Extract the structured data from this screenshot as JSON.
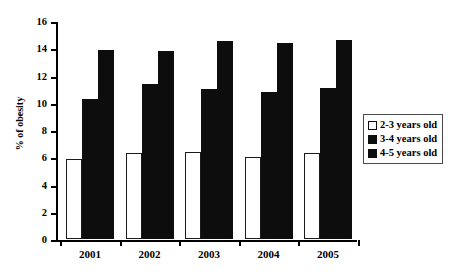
{
  "chart_data": {
    "type": "bar",
    "title": "",
    "xlabel": "",
    "ylabel": "% of obesity",
    "ylim": [
      0,
      16
    ],
    "ytick_labels": [
      "0",
      "2",
      "4",
      "6",
      "8",
      "10",
      "12",
      "14",
      "16"
    ],
    "ytick_values": [
      0,
      2,
      4,
      6,
      8,
      10,
      12,
      14,
      16
    ],
    "grid": false,
    "legend_position": "right",
    "categories": [
      "2001",
      "2002",
      "2003",
      "2004",
      "2005"
    ],
    "series": [
      {
        "name": "2-3 years old",
        "style": "open",
        "color": "#ffffff",
        "values": [
          5.9,
          6.3,
          6.4,
          6.0,
          6.3
        ]
      },
      {
        "name": "3-4 years old",
        "style": "filled",
        "color": "#0d0d0d",
        "values": [
          10.3,
          11.4,
          11.0,
          10.8,
          11.1
        ]
      },
      {
        "name": "4-5 years old",
        "style": "filled",
        "color": "#0d0d0d",
        "values": [
          13.9,
          13.8,
          14.5,
          14.4,
          14.6
        ]
      }
    ]
  }
}
